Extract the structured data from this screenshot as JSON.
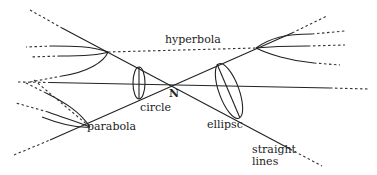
{
  "diagram": {
    "labels": {
      "hyperbola": "hyperbola",
      "circle": "circle",
      "apex": "N",
      "parabola": "parabola",
      "ellipse": "ellipsc",
      "straight_1": "straight",
      "straight_2": "lines"
    },
    "colors": {
      "line": "#222222",
      "background": "#ffffff"
    }
  }
}
